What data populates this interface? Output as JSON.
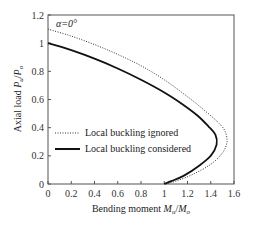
{
  "chart_data": {
    "type": "line",
    "title": "",
    "annotation": "α=0°",
    "xlabel": "Bending moment M_u/M_o",
    "ylabel": "Axial load P_u/P_o",
    "xlim": [
      0,
      1.6
    ],
    "ylim": [
      0,
      1.2
    ],
    "xticks": [
      0,
      0.2,
      0.4,
      0.6,
      0.8,
      1,
      1.2,
      1.4,
      1.6
    ],
    "yticks": [
      0,
      0.2,
      0.4,
      0.6,
      0.8,
      1,
      1.2
    ],
    "xtick_labels": [
      "0",
      "0.2",
      "0.4",
      "0.6",
      "0.8",
      "1",
      "1.2",
      "1.4",
      "1.6"
    ],
    "ytick_labels": [
      "0",
      "0.2",
      "0.4",
      "0.6",
      "0.8",
      "1",
      "1.2"
    ],
    "grid": false,
    "legend_position": "center-left",
    "series": [
      {
        "name": "Local buckling ignored",
        "style": "dotted",
        "color": "#333333",
        "points": [
          [
            0,
            1.1
          ],
          [
            0.2,
            1.05
          ],
          [
            0.4,
            0.99
          ],
          [
            0.6,
            0.92
          ],
          [
            0.8,
            0.84
          ],
          [
            1.0,
            0.74
          ],
          [
            1.2,
            0.62
          ],
          [
            1.35,
            0.52
          ],
          [
            1.46,
            0.44
          ],
          [
            1.52,
            0.38
          ],
          [
            1.54,
            0.3
          ],
          [
            1.5,
            0.22
          ],
          [
            1.4,
            0.14
          ],
          [
            1.25,
            0.07
          ],
          [
            1.1,
            0.02
          ],
          [
            1.0,
            0.0
          ]
        ]
      },
      {
        "name": "Local buckling considered",
        "style": "solid",
        "color": "#111111",
        "points": [
          [
            0,
            1.0
          ],
          [
            0.2,
            0.95
          ],
          [
            0.4,
            0.89
          ],
          [
            0.6,
            0.82
          ],
          [
            0.8,
            0.74
          ],
          [
            1.0,
            0.65
          ],
          [
            1.15,
            0.57
          ],
          [
            1.28,
            0.49
          ],
          [
            1.38,
            0.41
          ],
          [
            1.44,
            0.35
          ],
          [
            1.45,
            0.28
          ],
          [
            1.4,
            0.2
          ],
          [
            1.3,
            0.13
          ],
          [
            1.17,
            0.06
          ],
          [
            1.06,
            0.02
          ],
          [
            1.0,
            0.0
          ]
        ]
      }
    ]
  },
  "labels": {
    "annotation": "α=0°",
    "xlabel_prefix": "Bending moment ",
    "xlabel_var1": "M",
    "xlabel_sub1": "u",
    "xlabel_slash": "/",
    "xlabel_var2": "M",
    "xlabel_sub2": "o",
    "ylabel_prefix": "Axial load ",
    "ylabel_var1": "P",
    "ylabel_sub1": "u",
    "ylabel_slash": "/",
    "ylabel_var2": "P",
    "ylabel_sub2": "o",
    "legend_ignored": "Local buckling ignored",
    "legend_considered": "Local buckling considered"
  }
}
